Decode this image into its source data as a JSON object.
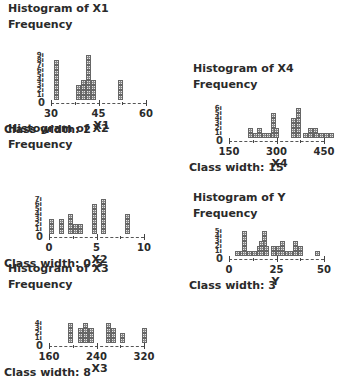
{
  "chart_data": [
    {
      "type": "bar",
      "id": "x1",
      "title": "Histogram of X1",
      "ylabel": "Frequency",
      "xlabel": "X1",
      "class_width_label": "Class width: 2",
      "class_width": 2,
      "xlim": [
        30,
        60
      ],
      "ylim": [
        0,
        9
      ],
      "x_ticks": [
        30,
        45,
        60
      ],
      "y_ticks": [
        0,
        1,
        2,
        3,
        4,
        5,
        6,
        7,
        8,
        9
      ],
      "bins": [
        {
          "x": 31,
          "count": 8,
          "cols": [
            8
          ]
        },
        {
          "x": 38,
          "count": 3,
          "cols": [
            3,
            4,
            4,
            4
          ]
        },
        {
          "x": 41,
          "count": 9,
          "cols": [
            9,
            4
          ]
        },
        {
          "x": 51,
          "count": 4,
          "cols": [
            4
          ]
        }
      ]
    },
    {
      "type": "bar",
      "id": "x2",
      "title": "Histogram of X2",
      "ylabel": "Frequency",
      "xlabel": "X2",
      "class_width_label": "Class width: 0.5",
      "class_width": 0.5,
      "xlim": [
        0,
        10
      ],
      "ylim": [
        0,
        7
      ],
      "x_ticks": [
        0,
        5,
        10
      ],
      "y_ticks": [
        0,
        1,
        2,
        3,
        4,
        5,
        6,
        7
      ],
      "bins": [
        {
          "x": 0.0,
          "count": 3,
          "cols": [
            3
          ]
        },
        {
          "x": 1.0,
          "count": 3,
          "cols": [
            3
          ]
        },
        {
          "x": 2.0,
          "count": 4,
          "cols": [
            4,
            2
          ]
        },
        {
          "x": 3.0,
          "count": 2,
          "cols": [
            2
          ]
        },
        {
          "x": 4.5,
          "count": 6,
          "cols": [
            6
          ]
        },
        {
          "x": 5.5,
          "count": 7,
          "cols": [
            7
          ]
        },
        {
          "x": 8.0,
          "count": 4,
          "cols": [
            4
          ]
        }
      ]
    },
    {
      "type": "bar",
      "id": "x3",
      "title": "Histogram of X3",
      "ylabel": "Frequency",
      "xlabel": "X3",
      "class_width_label": "Class width: 8",
      "class_width": 8,
      "xlim": [
        160,
        320
      ],
      "ylim": [
        0,
        4
      ],
      "x_ticks": [
        160,
        240,
        320
      ],
      "y_ticks": [
        0,
        1,
        2,
        3,
        4
      ],
      "bins": [
        {
          "x": 192,
          "count": 4,
          "cols": [
            4
          ]
        },
        {
          "x": 208,
          "count": 3,
          "cols": [
            3,
            3
          ]
        },
        {
          "x": 218,
          "count": 4,
          "cols": [
            4,
            3
          ]
        },
        {
          "x": 228,
          "count": 3,
          "cols": [
            3
          ]
        },
        {
          "x": 256,
          "count": 4,
          "cols": [
            4,
            3
          ]
        },
        {
          "x": 280,
          "count": 2,
          "cols": [
            2
          ]
        },
        {
          "x": 316,
          "count": 3,
          "cols": [
            3
          ]
        }
      ]
    },
    {
      "type": "bar",
      "id": "x4",
      "title": "Histogram of X4",
      "ylabel": "Frequency",
      "xlabel": "X4",
      "class_width_label": "Class width: 15",
      "class_width": 15,
      "xlim": [
        150,
        450
      ],
      "ylim": [
        0,
        6
      ],
      "x_ticks": [
        150,
        300,
        450
      ],
      "y_ticks": [
        0,
        1,
        2,
        3,
        4,
        5,
        6
      ],
      "bins": [
        {
          "x": 210,
          "count": 2,
          "cols": [
            2,
            1
          ]
        },
        {
          "x": 238,
          "count": 2,
          "cols": [
            2,
            1
          ]
        },
        {
          "x": 268,
          "count": 5,
          "cols": [
            1,
            5
          ]
        },
        {
          "x": 292,
          "count": 2,
          "cols": [
            2
          ]
        },
        {
          "x": 345,
          "count": 4,
          "cols": [
            4,
            4
          ]
        },
        {
          "x": 360,
          "count": 6,
          "cols": [
            6
          ]
        },
        {
          "x": 385,
          "count": 1,
          "cols": [
            1
          ]
        },
        {
          "x": 398,
          "count": 2,
          "cols": [
            2,
            2
          ]
        },
        {
          "x": 418,
          "count": 1,
          "cols": [
            1,
            1,
            1,
            1
          ]
        }
      ]
    },
    {
      "type": "bar",
      "id": "y",
      "title": "Histogram of Y",
      "ylabel": "Frequency",
      "xlabel": "Y",
      "class_width_label": "Class width: 3",
      "class_width": 3,
      "xlim": [
        0,
        50
      ],
      "ylim": [
        0,
        5
      ],
      "x_ticks": [
        0,
        25,
        50
      ],
      "y_ticks": [
        0,
        1,
        2,
        3,
        4,
        5
      ],
      "bins": [
        {
          "x": 3,
          "count": 1,
          "cols": [
            1,
            1
          ]
        },
        {
          "x": 7,
          "count": 5,
          "cols": [
            5,
            1
          ]
        },
        {
          "x": 12,
          "count": 2,
          "cols": [
            1,
            2,
            5
          ]
        },
        {
          "x": 16,
          "count": 3,
          "cols": [
            3,
            2
          ]
        },
        {
          "x": 22,
          "count": 2,
          "cols": [
            2,
            2
          ]
        },
        {
          "x": 27,
          "count": 3,
          "cols": [
            3,
            1
          ]
        },
        {
          "x": 31,
          "count": 3,
          "cols": [
            1,
            3,
            2
          ]
        },
        {
          "x": 45,
          "count": 1,
          "cols": [
            1
          ]
        }
      ]
    }
  ]
}
